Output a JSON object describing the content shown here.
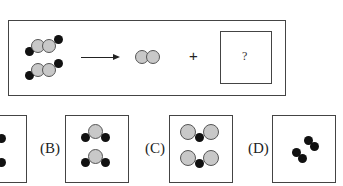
{
  "equation": {
    "reactant": "2 molecules: black-gray-gray-black chain",
    "arrow": "→",
    "product_1": "gray diatomic molecule",
    "plus": "+",
    "unknown": "?"
  },
  "options": [
    {
      "label": "(A)",
      "description": "partially visible"
    },
    {
      "label": "(B)",
      "description": "two molecules: black-gray-black bent"
    },
    {
      "label": "(C)",
      "description": "two molecules: gray-black-gray"
    },
    {
      "label": "(D)",
      "description": "two black diatomic molecules"
    }
  ]
}
